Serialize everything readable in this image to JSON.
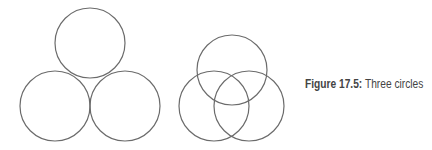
{
  "caption": {
    "label": "Figure 17.5:",
    "text": " Three circles"
  },
  "stroke_color": "#6b6b6b",
  "diagrams": [
    {
      "name": "tangent-circles",
      "circles": [
        {
          "cx": 90,
          "cy": 43,
          "r": 35
        },
        {
          "cx": 55,
          "cy": 106,
          "r": 35
        },
        {
          "cx": 125,
          "cy": 106,
          "r": 35
        }
      ]
    },
    {
      "name": "overlapping-circles",
      "circles": [
        {
          "cx": 232,
          "cy": 70,
          "r": 35
        },
        {
          "cx": 214,
          "cy": 106,
          "r": 35
        },
        {
          "cx": 249,
          "cy": 106,
          "r": 35
        }
      ]
    }
  ]
}
